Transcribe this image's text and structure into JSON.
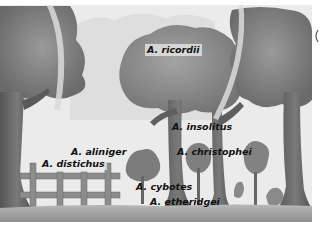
{
  "figure": {
    "type": "illustration",
    "palette": {
      "sky": "#ececec",
      "foliage_dark": "#6f6f6f",
      "foliage_mid": "#8c8c8c",
      "trunk": "#5e5e5e",
      "ground": "#a9a9a9",
      "fence": "#8a8a8a",
      "arc": "#dcdcdc",
      "label_text": "#111111"
    }
  },
  "labels": {
    "ricordii": "A. ricordii",
    "insolitus": "A. insolitus",
    "aliniger": "A. aliniger",
    "christophei": "A. christophei",
    "distichus": "A. distichus",
    "cybotes": "A. cybotes",
    "etheridgei": "A. etheridgei"
  }
}
